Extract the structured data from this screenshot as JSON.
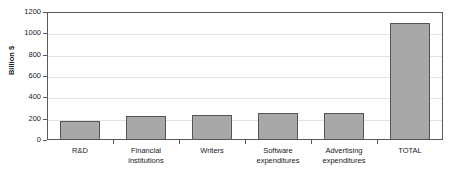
{
  "chart_data": {
    "type": "bar",
    "title": "",
    "xlabel": "",
    "ylabel": "Billion $",
    "categories": [
      "R&D",
      "Financial\ninstitutions",
      "Writers",
      "Software\nexpenditures",
      "Advertising\nexpenditures",
      "TOTAL"
    ],
    "values": [
      180,
      225,
      230,
      250,
      255,
      1100
    ],
    "ylim": [
      0,
      1200
    ],
    "ytick_labels": [
      "0",
      "200",
      "400",
      "600",
      "800",
      "1000",
      "1200"
    ],
    "ytick_values": [
      0,
      200,
      400,
      600,
      800,
      1000,
      1200
    ],
    "grid": true,
    "legend": "none",
    "colors": {
      "bar_fill": "#a8a8a8",
      "bar_border": "#555555",
      "axis": "#5a5a5a",
      "gridline": "#e2e2e2",
      "text": "#1a1a1a",
      "background": "#ffffff"
    }
  }
}
